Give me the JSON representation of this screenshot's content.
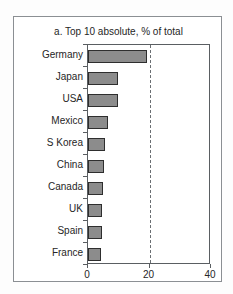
{
  "top_clip": {
    "left_text": "",
    "right_text": ""
  },
  "figure": {
    "title": "a. Top 10 absolute, % of total"
  },
  "colors": {
    "bar_fill": "#8c8c8c",
    "bar_stroke": "#2e2e2e",
    "axis": "#5a5e62",
    "frame": "#8b8f93",
    "text": "#262626",
    "reference_line": "#6a6e72"
  },
  "chart_data": {
    "type": "bar",
    "orientation": "horizontal",
    "title": "a. Top 10 absolute, % of total",
    "xlabel": "",
    "ylabel": "",
    "categories": [
      "Germany",
      "Japan",
      "USA",
      "Mexico",
      "S Korea",
      "China",
      "Canada",
      "UK",
      "Spain",
      "France"
    ],
    "values": [
      19.2,
      9.9,
      9.8,
      6.5,
      5.5,
      5.2,
      4.9,
      4.6,
      4.4,
      4.2
    ],
    "xlim": [
      0,
      40
    ],
    "xticks": [
      0,
      20,
      40
    ],
    "xtick_labels": [
      "0",
      "20",
      "40"
    ],
    "grid": false,
    "legend": false,
    "annotations": [
      {
        "type": "vertical-dashed-reference-line",
        "value": 20
      }
    ]
  }
}
